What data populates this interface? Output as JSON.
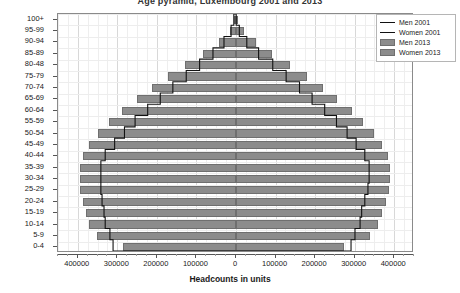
{
  "chart_data": {
    "type": "bar",
    "title": "Age pyramid, Luxembourg 2001 and 2013",
    "xlabel": "Headcounts in units",
    "ylabel": "",
    "orientation": "horizontal",
    "layout": "population-pyramid",
    "grid": true,
    "legend_position": "top-right",
    "xlim": [
      -450000,
      450000
    ],
    "xticks": [
      -400000,
      -300000,
      -200000,
      -100000,
      0,
      100000,
      200000,
      300000,
      400000
    ],
    "xtick_labels": [
      "400000",
      "300000",
      "200000",
      "100000",
      "0",
      "100000",
      "200000",
      "300000",
      "400000"
    ],
    "categories": [
      "0-4",
      "5-9",
      "10-14",
      "15-19",
      "20-24",
      "25-29",
      "30-34",
      "35-39",
      "40-44",
      "45-49",
      "50-54",
      "55-59",
      "60-64",
      "65-69",
      "70-74",
      "75-79",
      "80-48",
      "85-89",
      "90-94",
      "95-99",
      "100+"
    ],
    "series": [
      {
        "name": "Men 2001",
        "side": "left",
        "style": "outline",
        "color": "#111111",
        "values": [
          310000,
          318000,
          330000,
          333000,
          338000,
          341000,
          341000,
          341000,
          330000,
          306000,
          281000,
          254000,
          222000,
          190000,
          158000,
          124000,
          90000,
          56000,
          28000,
          10000,
          3000
        ]
      },
      {
        "name": "Women 2001",
        "side": "right",
        "style": "outline",
        "color": "#111111",
        "values": [
          295000,
          305000,
          318000,
          322000,
          330000,
          338000,
          341000,
          341000,
          330000,
          308000,
          285000,
          258000,
          228000,
          196000,
          164000,
          130000,
          96000,
          60000,
          30000,
          11000,
          3000
        ]
      },
      {
        "name": "Men 2013",
        "side": "left",
        "style": "filled",
        "color": "#8c8c8c",
        "values": [
          286000,
          352000,
          372000,
          380000,
          388000,
          394000,
          394000,
          394000,
          388000,
          372000,
          348000,
          320000,
          288000,
          250000,
          212000,
          172000,
          128000,
          84000,
          44000,
          16000,
          4000
        ]
      },
      {
        "name": "Women 2013",
        "side": "right",
        "style": "filled",
        "color": "#8c8c8c",
        "values": [
          272000,
          338000,
          360000,
          368000,
          378000,
          386000,
          390000,
          390000,
          384000,
          370000,
          348000,
          322000,
          292000,
          256000,
          220000,
          180000,
          136000,
          92000,
          50000,
          19000,
          5000
        ]
      }
    ]
  },
  "legend": {
    "items": [
      {
        "label": "Men 2001",
        "type": "line"
      },
      {
        "label": "Women 2001",
        "type": "line"
      },
      {
        "label": "Men 2013",
        "type": "swatch"
      },
      {
        "label": "Women 2013",
        "type": "swatch"
      }
    ]
  },
  "colors": {
    "bar_fill": "#8c8c8c",
    "bar_edge": "#6f6f6f",
    "outline": "#111111",
    "grid": "#d8d8d8",
    "frame": "#8a8a8a",
    "background": "#ffffff"
  }
}
